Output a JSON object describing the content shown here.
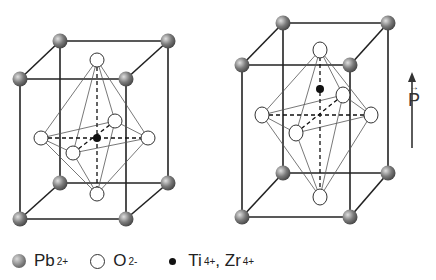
{
  "figure": {
    "cells": [
      {
        "name": "cubic-cell",
        "ti_position": "centered"
      },
      {
        "name": "tetragonal-cell",
        "ti_position": "displaced-up"
      }
    ],
    "polarization": {
      "symbol": "P",
      "vector_mark": "→",
      "direction": "up"
    },
    "legend": {
      "pb": {
        "label": "Pb",
        "charge": "2+"
      },
      "o": {
        "label": "O",
        "charge": "2-"
      },
      "ti_zr": {
        "label_ti": "Ti",
        "charge_ti": "4+",
        "separator": ",",
        "label_zr": "Zr",
        "charge_zr": "4+"
      }
    }
  }
}
